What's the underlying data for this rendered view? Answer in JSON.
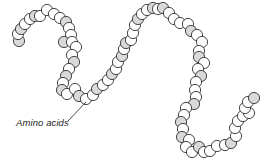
{
  "diagram": {
    "label": "Amino acids",
    "colors": {
      "background": "#ffffff",
      "bead_fill": "#ffffff",
      "bead_shaded_fill": "#d9d9d9",
      "stroke": "#333333"
    },
    "bead_radius": 5.6,
    "beads": [
      {
        "x": 19,
        "y": 41,
        "s": true
      },
      {
        "x": 18,
        "y": 34,
        "s": false
      },
      {
        "x": 21,
        "y": 29,
        "s": true
      },
      {
        "x": 25,
        "y": 24,
        "s": false
      },
      {
        "x": 30,
        "y": 19,
        "s": false
      },
      {
        "x": 35,
        "y": 16,
        "s": true
      },
      {
        "x": 40,
        "y": 16,
        "s": false
      },
      {
        "x": 47,
        "y": 10,
        "s": false
      },
      {
        "x": 54,
        "y": 14,
        "s": false
      },
      {
        "x": 60,
        "y": 18,
        "s": false
      },
      {
        "x": 66,
        "y": 22,
        "s": true
      },
      {
        "x": 69,
        "y": 28,
        "s": false
      },
      {
        "x": 71,
        "y": 35,
        "s": false
      },
      {
        "x": 64,
        "y": 42,
        "s": true
      },
      {
        "x": 72,
        "y": 42,
        "s": false
      },
      {
        "x": 76,
        "y": 47,
        "s": false
      },
      {
        "x": 72,
        "y": 55,
        "s": false
      },
      {
        "x": 74,
        "y": 62,
        "s": true
      },
      {
        "x": 69,
        "y": 69,
        "s": false
      },
      {
        "x": 66,
        "y": 76,
        "s": true
      },
      {
        "x": 63,
        "y": 83,
        "s": false
      },
      {
        "x": 62,
        "y": 90,
        "s": true
      },
      {
        "x": 67,
        "y": 94,
        "s": false
      },
      {
        "x": 75,
        "y": 89,
        "s": false
      },
      {
        "x": 79,
        "y": 96,
        "s": true
      },
      {
        "x": 86,
        "y": 99,
        "s": false
      },
      {
        "x": 93,
        "y": 95,
        "s": false
      },
      {
        "x": 97,
        "y": 89,
        "s": true
      },
      {
        "x": 103,
        "y": 85,
        "s": false
      },
      {
        "x": 108,
        "y": 80,
        "s": false
      },
      {
        "x": 112,
        "y": 74,
        "s": true
      },
      {
        "x": 116,
        "y": 69,
        "s": false
      },
      {
        "x": 118,
        "y": 62,
        "s": false
      },
      {
        "x": 122,
        "y": 56,
        "s": true
      },
      {
        "x": 124,
        "y": 49,
        "s": false
      },
      {
        "x": 126,
        "y": 43,
        "s": true
      },
      {
        "x": 131,
        "y": 40,
        "s": false
      },
      {
        "x": 133,
        "y": 33,
        "s": false
      },
      {
        "x": 135,
        "y": 25,
        "s": false
      },
      {
        "x": 138,
        "y": 19,
        "s": true
      },
      {
        "x": 142,
        "y": 14,
        "s": false
      },
      {
        "x": 147,
        "y": 10,
        "s": false
      },
      {
        "x": 153,
        "y": 8,
        "s": true
      },
      {
        "x": 158,
        "y": 9,
        "s": false
      },
      {
        "x": 163,
        "y": 8,
        "s": true
      },
      {
        "x": 169,
        "y": 13,
        "s": false
      },
      {
        "x": 174,
        "y": 19,
        "s": false
      },
      {
        "x": 180,
        "y": 23,
        "s": false
      },
      {
        "x": 188,
        "y": 24,
        "s": false
      },
      {
        "x": 191,
        "y": 31,
        "s": true
      },
      {
        "x": 197,
        "y": 35,
        "s": false
      },
      {
        "x": 202,
        "y": 42,
        "s": false
      },
      {
        "x": 199,
        "y": 51,
        "s": false
      },
      {
        "x": 199,
        "y": 57,
        "s": true
      },
      {
        "x": 204,
        "y": 63,
        "s": false
      },
      {
        "x": 198,
        "y": 69,
        "s": false
      },
      {
        "x": 201,
        "y": 76,
        "s": true
      },
      {
        "x": 196,
        "y": 82,
        "s": false
      },
      {
        "x": 195,
        "y": 90,
        "s": false
      },
      {
        "x": 196,
        "y": 97,
        "s": false
      },
      {
        "x": 194,
        "y": 104,
        "s": true
      },
      {
        "x": 186,
        "y": 108,
        "s": false
      },
      {
        "x": 184,
        "y": 115,
        "s": false
      },
      {
        "x": 181,
        "y": 122,
        "s": true
      },
      {
        "x": 183,
        "y": 129,
        "s": false
      },
      {
        "x": 182,
        "y": 137,
        "s": true
      },
      {
        "x": 189,
        "y": 140,
        "s": false
      },
      {
        "x": 186,
        "y": 147,
        "s": false
      },
      {
        "x": 192,
        "y": 152,
        "s": false
      },
      {
        "x": 199,
        "y": 147,
        "s": true
      },
      {
        "x": 204,
        "y": 152,
        "s": false
      },
      {
        "x": 210,
        "y": 151,
        "s": false
      },
      {
        "x": 217,
        "y": 146,
        "s": false
      },
      {
        "x": 225,
        "y": 145,
        "s": false
      },
      {
        "x": 231,
        "y": 143,
        "s": true
      },
      {
        "x": 236,
        "y": 136,
        "s": false
      },
      {
        "x": 235,
        "y": 128,
        "s": false
      },
      {
        "x": 238,
        "y": 121,
        "s": false
      },
      {
        "x": 243,
        "y": 116,
        "s": false
      },
      {
        "x": 249,
        "y": 113,
        "s": false
      },
      {
        "x": 245,
        "y": 108,
        "s": false
      },
      {
        "x": 248,
        "y": 102,
        "s": false
      },
      {
        "x": 254,
        "y": 98,
        "s": true
      }
    ],
    "leader_line": {
      "x1": 68,
      "y1": 121,
      "x2": 86,
      "y2": 102
    }
  }
}
